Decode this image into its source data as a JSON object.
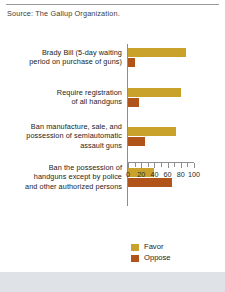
{
  "source_note": "Source: The Gallup Organization.",
  "legend": {
    "items": [
      {
        "label": "Favor",
        "color": "#c9a22b",
        "swatch_name": "favor-swatch"
      },
      {
        "label": "Oppose",
        "color": "#b0541a",
        "swatch_name": "oppose-swatch"
      }
    ]
  },
  "axis": {
    "tick_labels": [
      "0",
      "20",
      "40",
      "60",
      "80",
      "100"
    ]
  },
  "chart_data": {
    "type": "bar",
    "orientation": "horizontal",
    "title": "",
    "subtitle": "",
    "xlabel": "",
    "ylabel": "",
    "xlim": [
      0,
      100
    ],
    "grid": false,
    "legend_position": "bottom-center",
    "major_ticks": [
      0,
      20,
      40,
      60,
      80,
      100
    ],
    "minor_ticks": [
      10,
      30,
      50,
      70,
      90
    ],
    "categories": [
      "Brady Bill (5-day waiting period on purchase of guns)",
      "Require registration of all handguns",
      "Ban manufacture, sale, and possession of semiautomatic assault guns",
      "Ban the possession of handguns except by police and other authorized persons"
    ],
    "category_lines": [
      [
        "Brady Bill (5-day waiting",
        "period on purchase of guns)"
      ],
      [
        "Require registration",
        "of all handguns"
      ],
      [
        "Ban manufacture, sale, and",
        "possession of semiautomatic",
        "assault guns"
      ],
      [
        "Ban the possession of",
        "handguns except by police",
        "and other authorized persons"
      ]
    ],
    "series": [
      {
        "name": "Favor",
        "color": "#c9a22b",
        "values": [
          88,
          81,
          72,
          39
        ]
      },
      {
        "name": "Oppose",
        "color": "#b0541a",
        "values": [
          10,
          17,
          26,
          67
        ]
      }
    ]
  }
}
